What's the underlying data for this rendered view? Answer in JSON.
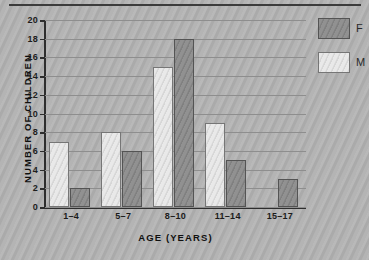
{
  "chart_data": {
    "type": "bar",
    "title": "",
    "xlabel": "AGE (YEARS)",
    "ylabel": "NUMBER OF CHILDREN",
    "categories": [
      "1–4",
      "5–7",
      "8–10",
      "11–14",
      "15–17"
    ],
    "series": [
      {
        "name": "M",
        "values": [
          7,
          8,
          15,
          9,
          0
        ]
      },
      {
        "name": "F",
        "values": [
          2,
          6,
          18,
          5,
          3
        ]
      }
    ],
    "ylim": [
      0,
      20
    ],
    "ytick_step": 2,
    "ytick_labels": [
      "0",
      "2",
      "4",
      "6",
      "8",
      "10",
      "12",
      "14",
      "16",
      "18",
      "20"
    ],
    "grid": true,
    "legend_position": "top-right",
    "legend": [
      {
        "label": "F",
        "color": "#8a8a8a",
        "pattern": "solid-gray"
      },
      {
        "label": "M",
        "color": "#e9e9e9",
        "pattern": "diagonal-hatch"
      }
    ],
    "colors": {
      "series_f": "#8a8a8a",
      "series_m": "#e9e9e9",
      "background": "#b2b2b2",
      "axis": "#2e2e2e",
      "gridline": "#8e8e8e",
      "text": "#101010"
    }
  }
}
